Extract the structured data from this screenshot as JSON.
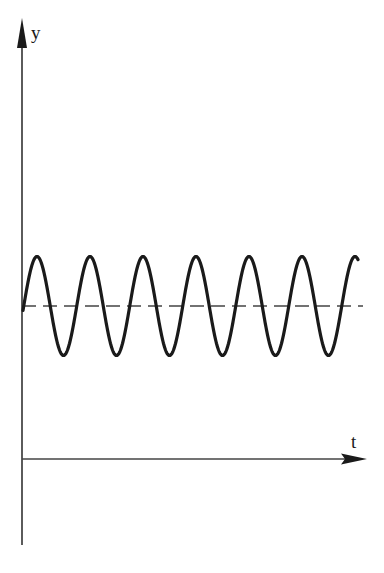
{
  "diagram": {
    "y_axis_label": "y",
    "x_axis_label": "t",
    "wave": {
      "description": "sinusoidal oscillation about a positive equilibrium offset",
      "cycles_visible": 6.5,
      "style": "solid"
    },
    "equilibrium_line": {
      "description": "dashed horizontal line marking the mean value",
      "style": "dashed"
    }
  },
  "chart_data": {
    "type": "line",
    "title": "",
    "xlabel": "t",
    "ylabel": "y",
    "series": [
      {
        "name": "y(t) oscillation",
        "style": "solid",
        "equation_form": "y = y0 + A sin(ωt + φ)",
        "relative_offset": 1.0,
        "relative_amplitude": 0.32
      },
      {
        "name": "mean level y0",
        "style": "dashed",
        "relative_offset": 1.0
      }
    ],
    "grid": false,
    "legend": "none"
  },
  "colors": {
    "stroke": "#1a1a1a",
    "axis": "#333333",
    "background": "#ffffff"
  }
}
